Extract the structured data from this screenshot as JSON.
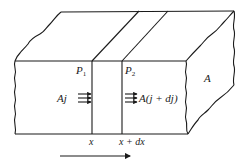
{
  "diagram": {
    "type": "slab-cross-section-flux",
    "labels": {
      "plane1": "P",
      "plane1_sub": "1",
      "plane2": "P",
      "plane2_sub": "2",
      "area": "A",
      "flux_in": "Aj",
      "flux_out": "A(j + dj)",
      "x_left": "x",
      "x_right": "x + dx"
    },
    "direction_arrow": "right",
    "colors": {
      "stroke": "#1a1a1a",
      "background": "#ffffff"
    }
  }
}
